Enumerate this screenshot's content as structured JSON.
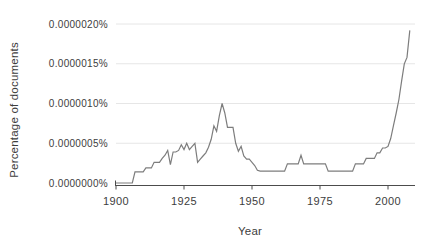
{
  "chart_data": {
    "type": "line",
    "xlabel": "Year",
    "ylabel": "Percentage of documents",
    "legend": "none",
    "grid": "horizontal light-gray gridlines at each y tick",
    "x_range": [
      1900,
      2010
    ],
    "y_range_percent": [
      0.0,
      2e-06
    ],
    "value_unit": "1e-6 percent (0.5 means 0.0000005%)",
    "x_tick_years": [
      1900,
      1925,
      1950,
      1975,
      2000
    ],
    "x_tick_labels": [
      "1900",
      "1925",
      "1950",
      "1975",
      "2000"
    ],
    "y_tick_values": [
      2.0,
      1.5,
      1.0,
      0.5,
      0.0
    ],
    "y_tick_labels": [
      "0.0000020%",
      "0.0000015%",
      "0.0000010%",
      "0.0000005%",
      "0.0000000%"
    ],
    "colors": {
      "line": "#7d7d7d",
      "axis": "#4c4c4c",
      "grid": "#e6e6e6",
      "text": "#3d3d3d",
      "background": "#ffffff"
    },
    "series": [
      {
        "name": "percentage-of-documents",
        "x": [
          1900,
          1901,
          1902,
          1903,
          1904,
          1905,
          1906,
          1907,
          1908,
          1909,
          1910,
          1911,
          1912,
          1913,
          1914,
          1915,
          1916,
          1917,
          1918,
          1919,
          1920,
          1921,
          1922,
          1923,
          1924,
          1925,
          1926,
          1927,
          1928,
          1929,
          1930,
          1931,
          1932,
          1933,
          1934,
          1935,
          1936,
          1937,
          1938,
          1939,
          1940,
          1941,
          1942,
          1943,
          1944,
          1945,
          1946,
          1947,
          1948,
          1949,
          1950,
          1951,
          1952,
          1953,
          1954,
          1955,
          1956,
          1957,
          1958,
          1959,
          1960,
          1961,
          1962,
          1963,
          1964,
          1965,
          1966,
          1967,
          1968,
          1969,
          1970,
          1971,
          1972,
          1973,
          1974,
          1975,
          1976,
          1977,
          1978,
          1979,
          1980,
          1981,
          1982,
          1983,
          1984,
          1985,
          1986,
          1987,
          1988,
          1989,
          1990,
          1991,
          1992,
          1993,
          1994,
          1995,
          1996,
          1997,
          1998,
          1999,
          2000,
          2001,
          2002,
          2003,
          2004,
          2005,
          2006,
          2007,
          2008
        ],
        "values": [
          0,
          0,
          0,
          0,
          0,
          0,
          0,
          0.14,
          0.14,
          0.14,
          0.14,
          0.19,
          0.19,
          0.19,
          0.26,
          0.26,
          0.26,
          0.31,
          0.35,
          0.41,
          0.23,
          0.39,
          0.39,
          0.41,
          0.48,
          0.42,
          0.5,
          0.42,
          0.46,
          0.5,
          0.26,
          0.3,
          0.34,
          0.38,
          0.45,
          0.55,
          0.72,
          0.65,
          0.85,
          1.0,
          0.88,
          0.7,
          0.7,
          0.7,
          0.5,
          0.4,
          0.46,
          0.34,
          0.3,
          0.3,
          0.26,
          0.22,
          0.16,
          0.15,
          0.15,
          0.15,
          0.15,
          0.15,
          0.15,
          0.15,
          0.15,
          0.15,
          0.15,
          0.24,
          0.24,
          0.24,
          0.24,
          0.24,
          0.35,
          0.24,
          0.24,
          0.24,
          0.24,
          0.24,
          0.24,
          0.24,
          0.24,
          0.24,
          0.15,
          0.15,
          0.15,
          0.15,
          0.15,
          0.15,
          0.15,
          0.15,
          0.15,
          0.15,
          0.24,
          0.24,
          0.24,
          0.24,
          0.31,
          0.31,
          0.31,
          0.31,
          0.38,
          0.38,
          0.44,
          0.44,
          0.46,
          0.56,
          0.72,
          0.88,
          1.05,
          1.28,
          1.5,
          1.58,
          1.92
        ]
      }
    ]
  }
}
